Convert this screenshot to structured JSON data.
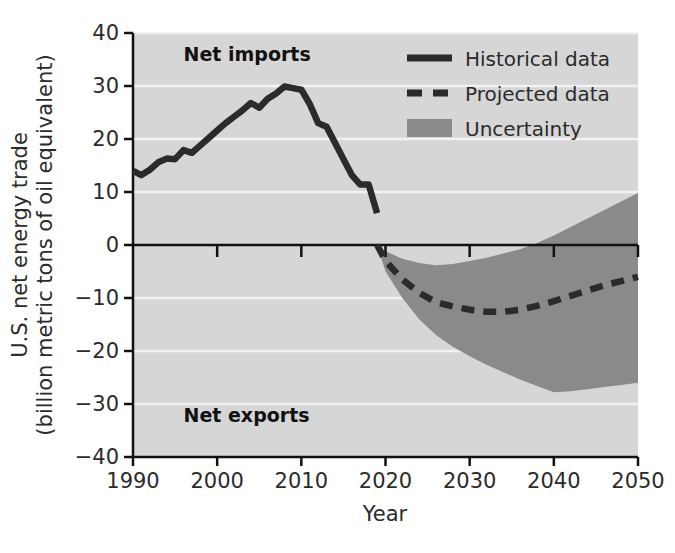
{
  "chart_data": {
    "type": "line",
    "title": "",
    "xlabel": "Year",
    "ylabel": "U.S. net energy trade\n(billion metric tons of oil equivalent)",
    "ylabel_line1": "U.S. net energy trade",
    "ylabel_line2": "(billion metric tons of oil equivalent)",
    "xlim": [
      1990,
      2050
    ],
    "ylim": [
      -40,
      40
    ],
    "xticks": [
      1990,
      2000,
      2010,
      2020,
      2030,
      2040,
      2050
    ],
    "xtick_labels": [
      "1990",
      "2000",
      "2010",
      "2020",
      "2030",
      "2040",
      "2050"
    ],
    "yticks": [
      40,
      30,
      20,
      10,
      0,
      -10,
      -20,
      -30,
      -40
    ],
    "ytick_labels": [
      "40",
      "30",
      "20",
      "10",
      "0",
      "−10",
      "−20",
      "−30",
      "−40"
    ],
    "grid": "horizontal-white-gridlines",
    "plot_background": "#d6d6d6",
    "gridline_color": "#f2f2f2",
    "zero_line_color": "#111111",
    "legend_position": "top-right",
    "annotations": [
      {
        "text": "Net imports",
        "x": 1996,
        "y": 36,
        "bold": true
      },
      {
        "text": "Net exports",
        "x": 1996,
        "y": -32,
        "bold": true
      }
    ],
    "series": [
      {
        "name": "Historical data",
        "style": "solid",
        "color": "#2b2b2b",
        "x": [
          1990,
          1991,
          1992,
          1993,
          1994,
          1995,
          1996,
          1997,
          1998,
          1999,
          2000,
          2001,
          2002,
          2003,
          2004,
          2005,
          2006,
          2007,
          2008,
          2009,
          2010,
          2011,
          2012,
          2013,
          2014,
          2015,
          2016,
          2017,
          2018,
          2019
        ],
        "values": [
          14.0,
          13.2,
          14.2,
          15.6,
          16.3,
          16.2,
          17.9,
          17.4,
          18.8,
          20.2,
          21.6,
          23.0,
          24.2,
          25.4,
          26.8,
          25.9,
          27.6,
          28.6,
          29.9,
          29.6,
          29.3,
          26.6,
          23.0,
          22.3,
          19.3,
          16.2,
          13.2,
          11.4,
          11.4,
          6.0
        ]
      },
      {
        "name": "Projected data",
        "style": "dashed",
        "color": "#2b2b2b",
        "x": [
          2019,
          2020,
          2022,
          2024,
          2026,
          2028,
          2030,
          2032,
          2034,
          2036,
          2038,
          2040,
          2042,
          2044,
          2046,
          2048,
          2050
        ],
        "values": [
          0.0,
          -3.0,
          -6.5,
          -9.0,
          -10.8,
          -11.6,
          -12.2,
          -12.6,
          -12.6,
          -12.2,
          -11.5,
          -10.6,
          -9.6,
          -8.6,
          -7.6,
          -6.8,
          -6.0
        ]
      }
    ],
    "bands": [
      {
        "name": "Uncertainty",
        "color": "#8a8a8a",
        "x": [
          2019,
          2020,
          2022,
          2024,
          2026,
          2028,
          2030,
          2032,
          2034,
          2036,
          2038,
          2040,
          2042,
          2044,
          2046,
          2048,
          2050
        ],
        "upper": [
          0.0,
          -1.2,
          -2.6,
          -3.4,
          -3.8,
          -3.6,
          -3.0,
          -2.4,
          -1.6,
          -0.8,
          0.4,
          1.8,
          3.4,
          5.0,
          6.6,
          8.2,
          9.8
        ],
        "lower": [
          0.0,
          -5.0,
          -10.0,
          -14.0,
          -17.0,
          -19.2,
          -21.0,
          -22.6,
          -24.0,
          -25.4,
          -26.6,
          -27.8,
          -27.6,
          -27.2,
          -26.8,
          -26.4,
          -26.0
        ]
      }
    ],
    "legend": [
      {
        "label": "Historical data",
        "marker": "solid-line",
        "color": "#2b2b2b"
      },
      {
        "label": "Projected data",
        "marker": "dashed-line",
        "color": "#2b2b2b"
      },
      {
        "label": "Uncertainty",
        "marker": "filled-rect",
        "color": "#8a8a8a"
      }
    ]
  }
}
